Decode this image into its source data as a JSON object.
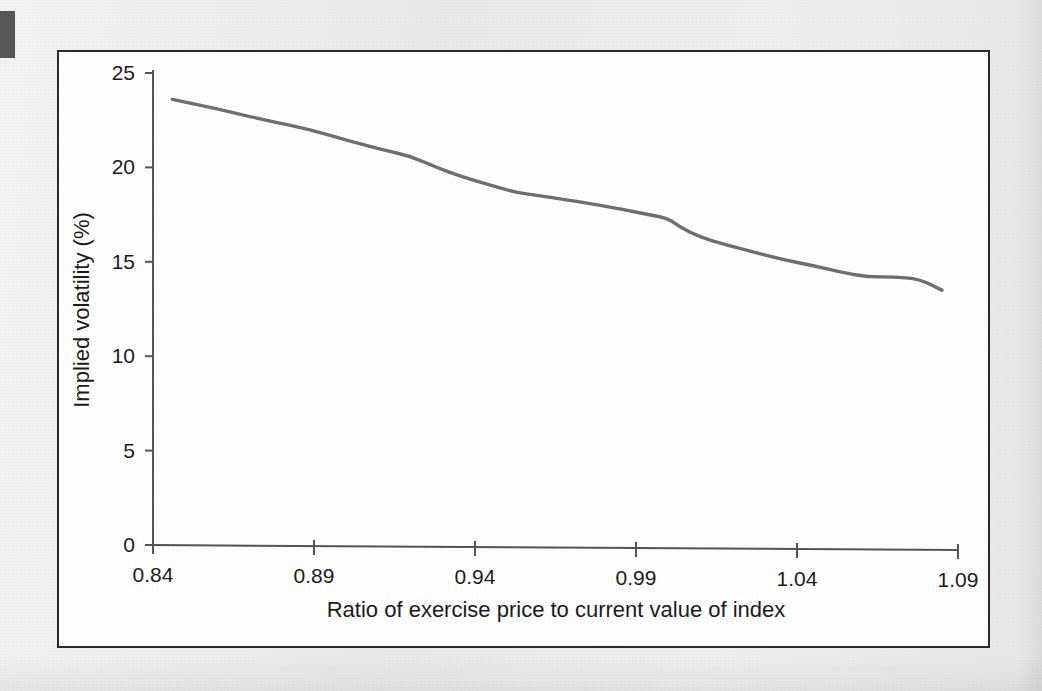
{
  "figure": {
    "background_color": "#ececeb",
    "panel_color": "#ffffff",
    "frame_color": "#2b2b2b",
    "line_color": "#6f6f6f",
    "text_color": "#1b1b1b"
  },
  "chart_data": {
    "type": "line",
    "title": "",
    "subtitle": "",
    "xlabel": "Ratio of exercise price to current value of index",
    "ylabel": "Implied volatility (%)",
    "xlim": [
      0.84,
      1.09
    ],
    "ylim": [
      0,
      25
    ],
    "xticks": [
      0.84,
      0.89,
      0.94,
      0.99,
      1.04,
      1.09
    ],
    "xticklabels": [
      "0.84",
      "0.89",
      "0.94",
      "0.99",
      "1.04",
      "1.09"
    ],
    "yticks": [
      0,
      5,
      10,
      15,
      20,
      25
    ],
    "yticklabels": [
      "0",
      "5",
      "10",
      "15",
      "20",
      "25"
    ],
    "grid": false,
    "legend": false,
    "legend_position": "none",
    "series": [
      {
        "name": "Implied volatility",
        "color": "#6f6f6f",
        "x": [
          0.846,
          0.86,
          0.875,
          0.889,
          0.901,
          0.912,
          0.92,
          0.928,
          0.936,
          0.944,
          0.952,
          0.96,
          0.968,
          0.975,
          0.982,
          0.988,
          0.994,
          1.0,
          1.004,
          1.01,
          1.018,
          1.027,
          1.036,
          1.045,
          1.055,
          1.062,
          1.07,
          1.078,
          1.085
        ],
        "y": [
          23.6,
          23.1,
          22.5,
          22.0,
          21.4,
          20.9,
          20.6,
          20.0,
          19.5,
          19.1,
          18.7,
          18.5,
          18.3,
          18.1,
          17.9,
          17.7,
          17.5,
          17.3,
          16.8,
          16.3,
          15.9,
          15.5,
          15.1,
          14.8,
          14.4,
          14.2,
          14.2,
          14.1,
          13.5
        ]
      }
    ]
  }
}
